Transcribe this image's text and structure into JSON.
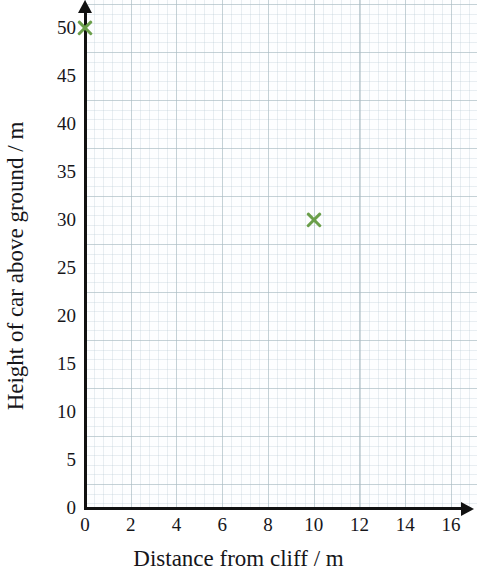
{
  "chart_data": {
    "type": "scatter",
    "title": "",
    "xlabel": "Distance from cliff / m",
    "ylabel": "Height of car above ground / m",
    "xlim": [
      0,
      16
    ],
    "ylim": [
      0,
      50
    ],
    "xticks": [
      0,
      2,
      4,
      6,
      8,
      10,
      12,
      14,
      16
    ],
    "yticks": [
      0,
      5,
      10,
      15,
      20,
      25,
      30,
      35,
      40,
      45,
      50
    ],
    "grid": true,
    "grid_style": "graph-paper-minor-and-major",
    "legend": "none",
    "marker_style": "cross",
    "marker_color": "#6a9e4a",
    "points": [
      {
        "x": 0,
        "y": 50,
        "label": "(0, 50)"
      },
      {
        "x": 10,
        "y": 30,
        "label": "(10, 30)"
      }
    ],
    "series": [
      {
        "name": "car trajectory points",
        "x": [
          0,
          10
        ],
        "values": [
          50,
          30
        ]
      }
    ]
  },
  "axes": {
    "y_tick_labels": [
      "0",
      "5",
      "10",
      "15",
      "20",
      "25",
      "30",
      "35",
      "40",
      "45",
      "50"
    ],
    "x_tick_labels": [
      "0",
      "2",
      "4",
      "6",
      "8",
      "10",
      "12",
      "14",
      "16"
    ],
    "x_title": "Distance from cliff / m",
    "y_title": "Height of car above ground / m"
  },
  "colors": {
    "marker": "#6a9e4a",
    "axis": "#111111",
    "grid_major": "#96aab4",
    "grid_minor": "#a5bec8",
    "paper": "#fdfeff",
    "text": "#16161a"
  }
}
